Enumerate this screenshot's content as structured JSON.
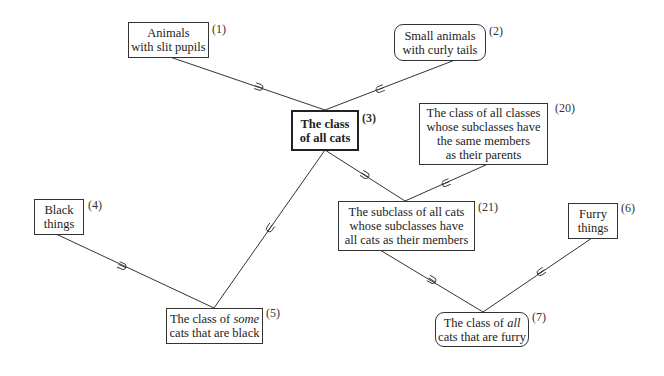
{
  "nodes": {
    "n1": {
      "id": "(1)",
      "lines": [
        "Animals",
        "with slit pupils"
      ]
    },
    "n2": {
      "id": "(2)",
      "lines": [
        "Small animals",
        "with curly tails"
      ]
    },
    "n3": {
      "id": "(3)",
      "lines": [
        "The class",
        "of all cats"
      ]
    },
    "n4": {
      "id": "(4)",
      "lines": [
        "Black",
        "things"
      ]
    },
    "n5": {
      "id": "(5)",
      "line1_pre": "The class of ",
      "line1_em": "some",
      "line2": "cats that are black"
    },
    "n6": {
      "id": "(6)",
      "lines": [
        "Furry",
        "things"
      ]
    },
    "n7": {
      "id": "(7)",
      "line1_pre": "The class of ",
      "line1_em": "all",
      "line2": "cats that are furry"
    },
    "n20": {
      "id": "(20)",
      "lines": [
        "The class of all classes",
        "whose subclasses have",
        "the same members",
        "as their parents"
      ]
    },
    "n21": {
      "id": "(21)",
      "lines": [
        "The subclass of all cats",
        "whose subclasses have",
        "all cats as their members"
      ]
    }
  },
  "edges": [
    {
      "from": "(1)",
      "to": "(3)",
      "marker": "⊃"
    },
    {
      "from": "(2)",
      "to": "(3)",
      "marker": "⊂"
    },
    {
      "from": "(3)",
      "to": "(5)",
      "marker": "⊂"
    },
    {
      "from": "(3)",
      "to": "(21)",
      "marker": "⊃"
    },
    {
      "from": "(20)",
      "to": "(21)",
      "marker": "⊂"
    },
    {
      "from": "(4)",
      "to": "(5)",
      "marker": "⊃"
    },
    {
      "from": "(21)",
      "to": "(7)",
      "marker": "⊃"
    },
    {
      "from": "(6)",
      "to": "(7)",
      "marker": "⊂"
    }
  ]
}
